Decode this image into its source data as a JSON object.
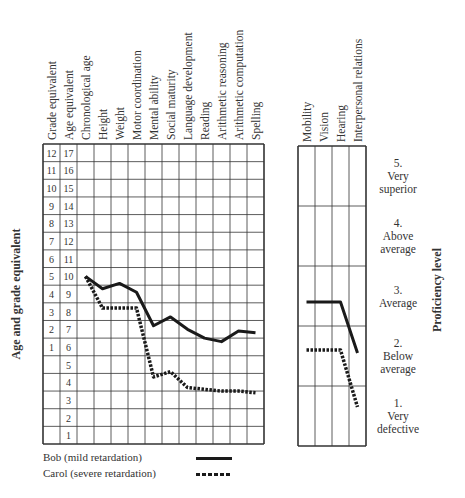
{
  "chart_data": [
    {
      "type": "line",
      "title": "",
      "ylabel": "Age and grade equivalent",
      "y_axis_columns": [
        {
          "header": "Grade equivalent",
          "ticks": [
            "12",
            "11",
            "10",
            "9",
            "8",
            "7",
            "6",
            "5",
            "4",
            "3",
            "2",
            "1",
            "",
            "",
            "",
            "",
            ""
          ]
        },
        {
          "header": "Age equivalent",
          "ticks": [
            "17",
            "16",
            "15",
            "14",
            "13",
            "12",
            "11",
            "10",
            "9",
            "8",
            "7",
            "6",
            "5",
            "4",
            "3",
            "2",
            "1"
          ]
        }
      ],
      "ylim": [
        0.5,
        17.5
      ],
      "grid": true,
      "categories": [
        "Chronological age",
        "Height",
        "Weight",
        "Motor coordination",
        "Mental ability",
        "Social maturity",
        "Language development",
        "Reading",
        "Arithmetic reasoning",
        "Arithmetic computation",
        "Spelling"
      ],
      "series": [
        {
          "name": "Bob (mild retardation)",
          "style": "solid",
          "values": [
            10.0,
            9.3,
            9.6,
            9.1,
            7.2,
            7.7,
            7.0,
            6.5,
            6.3,
            6.9,
            6.8
          ]
        },
        {
          "name": "Carol (severe retardation)",
          "style": "dashed",
          "values": [
            10.0,
            8.2,
            8.2,
            8.2,
            4.3,
            4.6,
            3.7,
            3.6,
            3.5,
            3.5,
            3.4
          ]
        }
      ]
    },
    {
      "type": "line",
      "title": "",
      "ylabel": "Proficiency level",
      "ylim": [
        0.5,
        5.5
      ],
      "grid": true,
      "categories": [
        "Mobility",
        "Vision",
        "Hearing",
        "Interpersonal relations"
      ],
      "levels": [
        {
          "num": "5.",
          "lines": [
            "Very",
            "superior"
          ]
        },
        {
          "num": "4.",
          "lines": [
            "Above",
            "average"
          ]
        },
        {
          "num": "3.",
          "lines": [
            "Average"
          ]
        },
        {
          "num": "2.",
          "lines": [
            "Below",
            "average"
          ]
        },
        {
          "num": "1.",
          "lines": [
            "Very",
            "defective"
          ]
        }
      ],
      "series": [
        {
          "name": "Bob (mild retardation)",
          "style": "solid",
          "values": [
            2.9,
            2.9,
            2.9,
            2.05
          ]
        },
        {
          "name": "Carol (severe retardation)",
          "style": "dashed",
          "values": [
            2.1,
            2.1,
            2.1,
            1.15
          ]
        }
      ]
    }
  ],
  "legend": [
    {
      "label": "Bob (mild retardation)",
      "style": "solid"
    },
    {
      "label": "Carol (severe retardation)",
      "style": "dashed"
    }
  ],
  "colors": {
    "line": "#1a1a1a",
    "grid": "#333333",
    "text": "#333333"
  }
}
